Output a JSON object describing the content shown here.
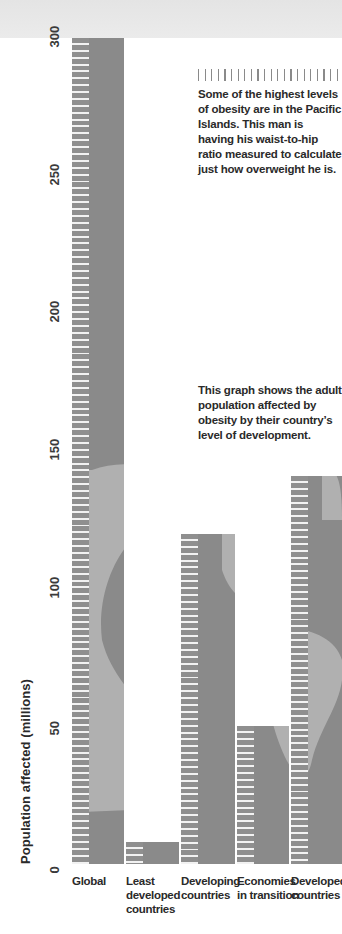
{
  "chart_data": {
    "type": "bar",
    "xlabel": "",
    "ylabel": "Population affected (millions)",
    "ylim": [
      0,
      300
    ],
    "yticks": [
      0,
      50,
      100,
      150,
      200,
      250,
      300
    ],
    "grid": false,
    "legend": null,
    "categories": [
      "Global",
      "Least developed countries",
      "Developing countries",
      "Economies in transition",
      "Developed countries"
    ],
    "values": [
      300,
      8,
      120,
      50,
      141
    ]
  },
  "axis": {
    "ylabel": "Population affected (millions)",
    "ticks": [
      "0",
      "50",
      "100",
      "150",
      "200",
      "250",
      "300"
    ]
  },
  "categories": [
    {
      "lines": [
        "Global"
      ]
    },
    {
      "lines": [
        "Least",
        "developed",
        "countries"
      ]
    },
    {
      "lines": [
        "Developing",
        "countries"
      ]
    },
    {
      "lines": [
        "Economies",
        "in transition"
      ]
    },
    {
      "lines": [
        "Developed",
        "countries"
      ]
    }
  ],
  "captions": {
    "photo": "Some of the highest levels of obesity are in the Pacific Islands. This man is having his waist-to-hip ratio measured to calculate just how overweight he is.",
    "graph": "This graph shows the adult population affected by obesity by their country’s level of development."
  },
  "colors": {
    "bar": "#8a8a8a",
    "land": "#b0b0b0",
    "tick": "#f2f2f2",
    "text": "#2a2a2a"
  }
}
